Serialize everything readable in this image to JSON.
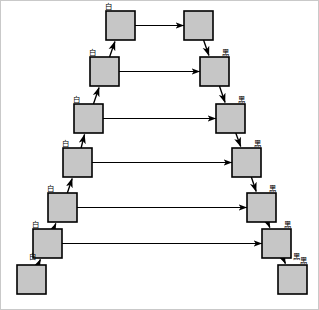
{
  "diagram": {
    "box_fill": "#c6c6c6",
    "box_stroke": "#000000",
    "arrow_color": "#000000",
    "frame_color": "#c9c9c9",
    "label_white": "白",
    "label_black": "黑",
    "left_chain": {
      "name": "white-chain",
      "direction": "upward-right",
      "nodes": [
        {
          "id": "L0",
          "x": 16,
          "y": 264,
          "w": 29,
          "h": 29
        },
        {
          "id": "L1",
          "x": 32,
          "y": 228,
          "w": 29,
          "h": 29
        },
        {
          "id": "L2",
          "x": 47,
          "y": 192,
          "w": 29,
          "h": 29
        },
        {
          "id": "L3",
          "x": 62,
          "y": 147,
          "w": 29,
          "h": 29
        },
        {
          "id": "L4",
          "x": 73,
          "y": 103,
          "w": 29,
          "h": 29
        },
        {
          "id": "L5",
          "x": 89,
          "y": 56,
          "w": 29,
          "h": 29
        },
        {
          "id": "L6",
          "x": 105,
          "y": 10,
          "w": 29,
          "h": 29
        }
      ],
      "edges": [
        {
          "from": "L0",
          "to": "L1",
          "label": "白"
        },
        {
          "from": "L1",
          "to": "L2",
          "label": "白"
        },
        {
          "from": "L2",
          "to": "L3",
          "label": "白"
        },
        {
          "from": "L3",
          "to": "L4",
          "label": "白"
        },
        {
          "from": "L4",
          "to": "L5",
          "label": "白"
        },
        {
          "from": "L5",
          "to": "L6",
          "label": "白"
        }
      ]
    },
    "right_chain": {
      "name": "black-chain",
      "direction": "downward-right",
      "nodes": [
        {
          "id": "R0",
          "x": 183,
          "y": 10,
          "w": 29,
          "h": 29
        },
        {
          "id": "R1",
          "x": 199,
          "y": 56,
          "w": 29,
          "h": 29
        },
        {
          "id": "R2",
          "x": 215,
          "y": 103,
          "w": 29,
          "h": 29
        },
        {
          "id": "R3",
          "x": 231,
          "y": 147,
          "w": 29,
          "h": 29
        },
        {
          "id": "R4",
          "x": 246,
          "y": 192,
          "w": 29,
          "h": 29
        },
        {
          "id": "R5",
          "x": 261,
          "y": 228,
          "w": 29,
          "h": 29
        },
        {
          "id": "R6",
          "x": 277,
          "y": 264,
          "w": 29,
          "h": 29
        }
      ],
      "edges": [
        {
          "from": "R0",
          "to": "R1",
          "label": "黑"
        },
        {
          "from": "R1",
          "to": "R2",
          "label": "黑"
        },
        {
          "from": "R2",
          "to": "R3",
          "label": "黑"
        },
        {
          "from": "R3",
          "to": "R4",
          "label": "黑"
        },
        {
          "from": "R4",
          "to": "R5",
          "label": "黑"
        },
        {
          "from": "R5",
          "to": "R6",
          "label": "黑"
        }
      ]
    },
    "cross_edges": [
      {
        "from": "L6",
        "to": "R0",
        "label": ""
      },
      {
        "from": "L5",
        "to": "R1",
        "label": ""
      },
      {
        "from": "L4",
        "to": "R2",
        "label": ""
      },
      {
        "from": "L3",
        "to": "R3",
        "label": ""
      },
      {
        "from": "L2",
        "to": "R4",
        "label": ""
      },
      {
        "from": "L1",
        "to": "R5",
        "label": ""
      }
    ],
    "extra_labels": [
      {
        "id": "lbl-L0",
        "text": "白",
        "x": 31,
        "y": 258
      },
      {
        "id": "lbl-R6",
        "text": "黑",
        "x": 295,
        "y": 258
      }
    ]
  }
}
